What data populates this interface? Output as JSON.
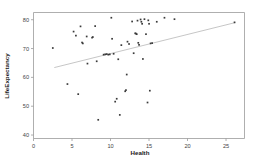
{
  "chart_data": {
    "type": "scatter",
    "title": "",
    "xlabel": "Health",
    "ylabel": "LifeExpectancy",
    "xlim": [
      0,
      27.4
    ],
    "ylim": [
      38.8,
      82.5
    ],
    "xticks": [
      0,
      5,
      10,
      15,
      20,
      25
    ],
    "yticks": [
      40,
      50,
      60,
      70,
      80
    ],
    "xtick_labels": [
      "0",
      "5",
      "10",
      "15",
      "20",
      "25"
    ],
    "ytick_labels": [
      "40",
      "50",
      "60",
      "70",
      "80"
    ],
    "grid": false,
    "legend": null,
    "marker_color": "#3a3a3a",
    "fit_line_color": "#b8b8b8",
    "frame_color": "#9a9a9a",
    "points": [
      {
        "x": 2.5,
        "y": 70.2
      },
      {
        "x": 4.4,
        "y": 57.7
      },
      {
        "x": 5.2,
        "y": 75.9
      },
      {
        "x": 5.5,
        "y": 74.5
      },
      {
        "x": 5.8,
        "y": 54.2
      },
      {
        "x": 6.1,
        "y": 77.7
      },
      {
        "x": 6.3,
        "y": 72.1
      },
      {
        "x": 6.4,
        "y": 71.8
      },
      {
        "x": 6.9,
        "y": 74.2
      },
      {
        "x": 7.0,
        "y": 64.8
      },
      {
        "x": 7.6,
        "y": 73.8
      },
      {
        "x": 7.7,
        "y": 74.0
      },
      {
        "x": 8.0,
        "y": 77.8
      },
      {
        "x": 8.2,
        "y": 65.6
      },
      {
        "x": 8.4,
        "y": 45.3
      },
      {
        "x": 9.1,
        "y": 67.9
      },
      {
        "x": 9.3,
        "y": 68.0
      },
      {
        "x": 9.5,
        "y": 68.1
      },
      {
        "x": 9.7,
        "y": 67.9
      },
      {
        "x": 9.9,
        "y": 68.0
      },
      {
        "x": 10.1,
        "y": 80.7
      },
      {
        "x": 10.2,
        "y": 73.4
      },
      {
        "x": 10.4,
        "y": 68.2
      },
      {
        "x": 10.6,
        "y": 51.6
      },
      {
        "x": 10.8,
        "y": 52.6
      },
      {
        "x": 11.0,
        "y": 66.3
      },
      {
        "x": 11.2,
        "y": 47.0
      },
      {
        "x": 11.4,
        "y": 71.2
      },
      {
        "x": 11.9,
        "y": 55.2
      },
      {
        "x": 12.0,
        "y": 55.6
      },
      {
        "x": 12.1,
        "y": 61.0
      },
      {
        "x": 12.2,
        "y": 72.4
      },
      {
        "x": 12.4,
        "y": 71.6
      },
      {
        "x": 12.8,
        "y": 79.4
      },
      {
        "x": 13.0,
        "y": 68.4
      },
      {
        "x": 13.2,
        "y": 75.3
      },
      {
        "x": 13.3,
        "y": 75.2
      },
      {
        "x": 13.4,
        "y": 75.0
      },
      {
        "x": 13.5,
        "y": 79.7
      },
      {
        "x": 13.6,
        "y": 72.0
      },
      {
        "x": 13.7,
        "y": 71.3
      },
      {
        "x": 13.9,
        "y": 80.1
      },
      {
        "x": 14.0,
        "y": 79.3
      },
      {
        "x": 14.1,
        "y": 78.6
      },
      {
        "x": 14.2,
        "y": 66.4
      },
      {
        "x": 14.4,
        "y": 80.2
      },
      {
        "x": 14.6,
        "y": 75.0
      },
      {
        "x": 14.8,
        "y": 51.3
      },
      {
        "x": 14.9,
        "y": 79.8
      },
      {
        "x": 15.0,
        "y": 78.6
      },
      {
        "x": 15.1,
        "y": 55.4
      },
      {
        "x": 15.2,
        "y": 71.8
      },
      {
        "x": 15.4,
        "y": 71.9
      },
      {
        "x": 16.0,
        "y": 79.3
      },
      {
        "x": 17.0,
        "y": 80.7
      },
      {
        "x": 18.3,
        "y": 80.2
      },
      {
        "x": 26.1,
        "y": 79.1
      }
    ],
    "fit_line": {
      "x1": 2.7,
      "y1": 63.4,
      "x2": 26.2,
      "y2": 79.0
    }
  }
}
